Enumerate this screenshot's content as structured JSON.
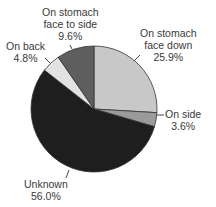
{
  "chart_data": {
    "type": "pie",
    "title": "",
    "slices": [
      {
        "label": "On stomach face down",
        "value": 25.9,
        "display": "25.9%",
        "color": "#c8c8c8"
      },
      {
        "label": "On side",
        "value": 3.6,
        "display": "3.6%",
        "color": "#9a9a9a"
      },
      {
        "label": "Unknown",
        "value": 56.0,
        "display": "56.0%",
        "color": "#1e1e1e"
      },
      {
        "label": "On back",
        "value": 4.8,
        "display": "4.8%",
        "color": "#e2e2e2"
      },
      {
        "label": "On stomach face to side",
        "value": 9.6,
        "display": "9.6%",
        "color": "#5e5e5e"
      }
    ],
    "start_angle_deg": 0,
    "direction": "clockwise",
    "legend": "none (direct labels)"
  },
  "labels": {
    "face_down": {
      "line1": "On stomach",
      "line2": "face down",
      "pct": "25.9%"
    },
    "side": {
      "line1": "On side",
      "pct": "3.6%"
    },
    "unknown": {
      "line1": "Unknown",
      "pct": "56.0%"
    },
    "back": {
      "line1": "On back",
      "pct": "4.8%"
    },
    "face_side": {
      "line1": "On stomach",
      "line2": "face to side",
      "pct": "9.6%"
    }
  }
}
